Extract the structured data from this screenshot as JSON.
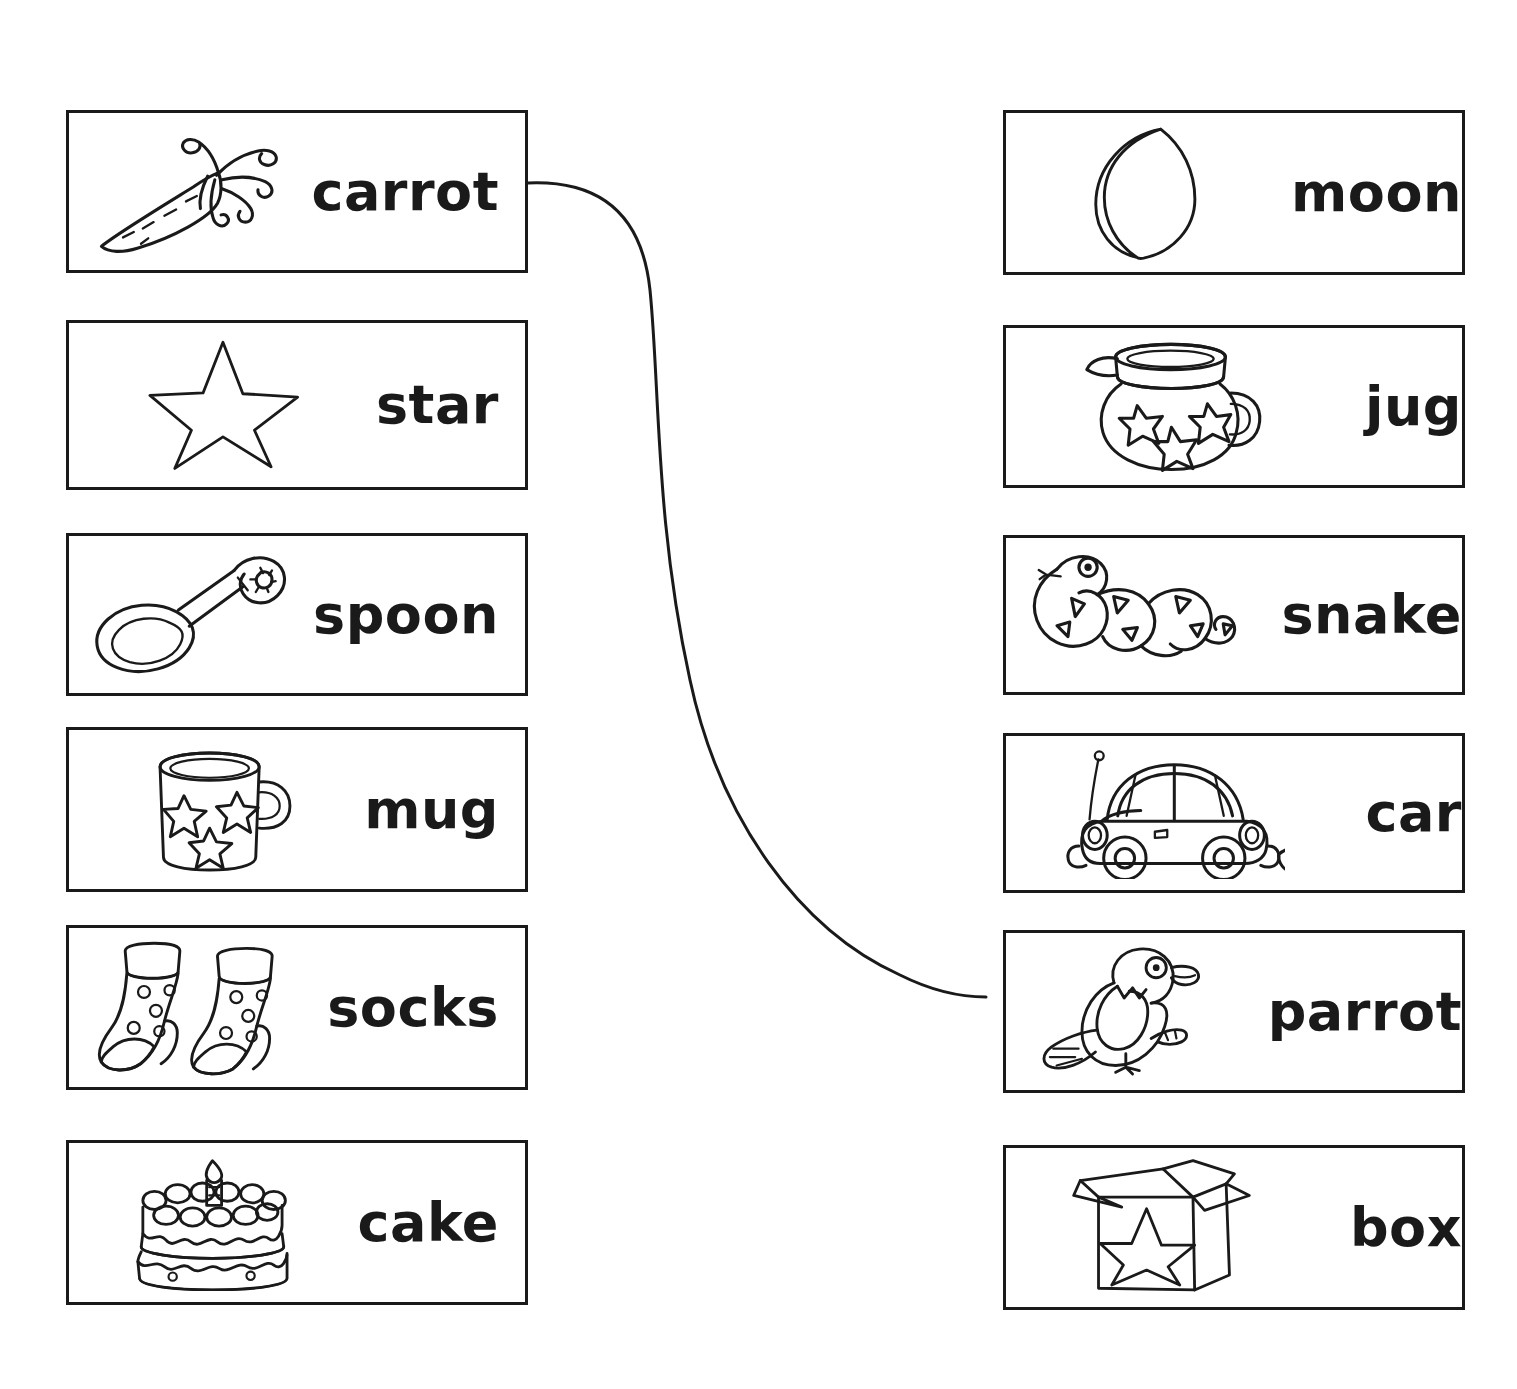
{
  "worksheet": {
    "title": "Picture-Word Matching Worksheet",
    "left_column": {
      "name": "left-word-picture-column",
      "items": [
        {
          "word": "carrot",
          "icon": "carrot-icon",
          "picture_side": "left"
        },
        {
          "word": "star",
          "icon": "star-icon",
          "picture_side": "left"
        },
        {
          "word": "spoon",
          "icon": "spoon-icon",
          "picture_side": "left"
        },
        {
          "word": "mug",
          "icon": "mug-icon",
          "picture_side": "left"
        },
        {
          "word": "socks",
          "icon": "socks-icon",
          "picture_side": "left"
        },
        {
          "word": "cake",
          "icon": "cake-icon",
          "picture_side": "left"
        }
      ]
    },
    "right_column": {
      "name": "right-word-picture-column",
      "items": [
        {
          "word": "moon",
          "icon": "moon-icon",
          "picture_side": "right"
        },
        {
          "word": "jug",
          "icon": "jug-icon",
          "picture_side": "right"
        },
        {
          "word": "snake",
          "icon": "snake-icon",
          "picture_side": "right"
        },
        {
          "word": "car",
          "icon": "car-icon",
          "picture_side": "right"
        },
        {
          "word": "parrot",
          "icon": "parrot-icon",
          "picture_side": "right"
        },
        {
          "word": "box",
          "icon": "box-icon",
          "picture_side": "right"
        }
      ]
    },
    "connections": [
      {
        "from": "carrot",
        "to": "parrot"
      }
    ],
    "colors": {
      "ink": "#1a1a1a",
      "paper": "#ffffff"
    }
  }
}
